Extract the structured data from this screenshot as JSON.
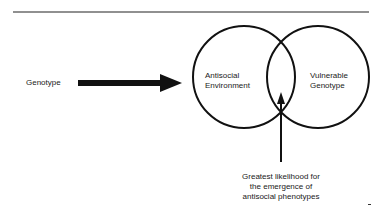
{
  "diagram": {
    "type": "venn-with-arrows",
    "input_label": "Genotype",
    "circles": [
      {
        "label_line1": "Antisocial",
        "label_line2": "Environment"
      },
      {
        "label_line1": "Vulnerable",
        "label_line2": "Genotype"
      }
    ],
    "callout": {
      "line1": "Greatest likelihood for",
      "line2": "the emergence of",
      "line3": "antisocial phenotypes"
    },
    "stroke_color": "#111111",
    "background": "#ffffff"
  }
}
